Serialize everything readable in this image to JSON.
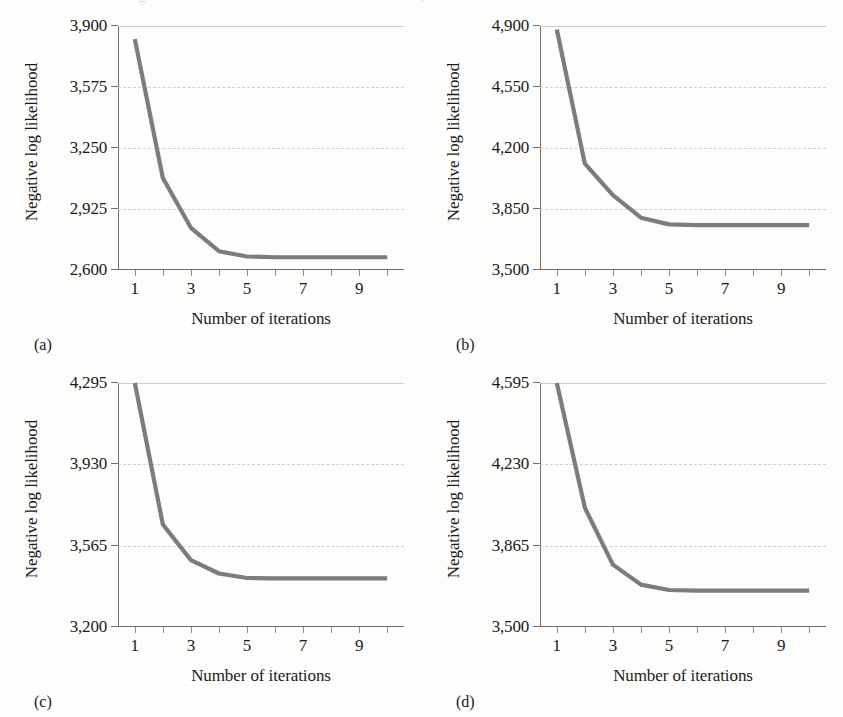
{
  "figure": {
    "background_color": "#fdfdfc",
    "curve_color": "#7c7c7c",
    "axis_color": "#6f6f6f",
    "gridline_color": "#c9c9cf",
    "top_bleed_a": "g",
    "top_bleed_b": "i"
  },
  "axis_titles": {
    "y": "Negative log likelihood",
    "x": "Number of iterations"
  },
  "captions": {
    "a": "(a)",
    "b": "(b)",
    "c": "(c)",
    "d": "(d)"
  },
  "chart_data": [
    {
      "id": "a",
      "type": "line",
      "title": "(a)",
      "xlabel": "Number of iterations",
      "ylabel": "Negative log likelihood",
      "x": [
        1,
        2,
        3,
        4,
        5,
        6,
        7,
        8,
        9,
        10
      ],
      "values": [
        3830,
        3090,
        2825,
        2700,
        2672,
        2668,
        2668,
        2668,
        2668,
        2668
      ],
      "series": [
        {
          "name": "Negative log likelihood",
          "values": [
            3830,
            3090,
            2825,
            2700,
            2672,
            2668,
            2668,
            2668,
            2668,
            2668
          ]
        }
      ],
      "xlim": [
        0.4,
        10.6
      ],
      "ylim": [
        2600,
        3900
      ],
      "yticks": [
        3900,
        3575,
        3250,
        2925,
        2600
      ],
      "ytick_labels": [
        "3,900",
        "3,575",
        "3,250",
        "2,925",
        "2,600"
      ],
      "xticks": [
        1,
        3,
        5,
        7,
        9
      ],
      "xtick_labels": [
        "1",
        "3",
        "5",
        "7",
        "9"
      ],
      "grid": true,
      "legend": "none"
    },
    {
      "id": "b",
      "type": "line",
      "title": "(b)",
      "xlabel": "Number of iterations",
      "ylabel": "Negative log likelihood",
      "x": [
        1,
        2,
        3,
        4,
        5,
        6,
        7,
        8,
        9,
        10
      ],
      "values": [
        4880,
        4110,
        3930,
        3800,
        3762,
        3758,
        3758,
        3758,
        3758,
        3758
      ],
      "series": [
        {
          "name": "Negative log likelihood",
          "values": [
            4880,
            4110,
            3930,
            3800,
            3762,
            3758,
            3758,
            3758,
            3758,
            3758
          ]
        }
      ],
      "xlim": [
        0.4,
        10.6
      ],
      "ylim": [
        3500,
        4900
      ],
      "yticks": [
        4900,
        4550,
        4200,
        3850,
        3500
      ],
      "ytick_labels": [
        "4,900",
        "4,550",
        "4,200",
        "3,850",
        "3,500"
      ],
      "xticks": [
        1,
        3,
        5,
        7,
        9
      ],
      "xtick_labels": [
        "1",
        "3",
        "5",
        "7",
        "9"
      ],
      "grid": true,
      "legend": "none"
    },
    {
      "id": "c",
      "type": "line",
      "title": "(c)",
      "xlabel": "Number of iterations",
      "ylabel": "Negative log likelihood",
      "x": [
        1,
        2,
        3,
        4,
        5,
        6,
        7,
        8,
        9,
        10
      ],
      "values": [
        4295,
        3660,
        3500,
        3440,
        3420,
        3418,
        3418,
        3418,
        3418,
        3418
      ],
      "series": [
        {
          "name": "Negative log likelihood",
          "values": [
            4295,
            3660,
            3500,
            3440,
            3420,
            3418,
            3418,
            3418,
            3418,
            3418
          ]
        }
      ],
      "xlim": [
        0.4,
        10.6
      ],
      "ylim": [
        3200,
        4295
      ],
      "yticks": [
        4295,
        3930,
        3565,
        3200
      ],
      "ytick_labels": [
        "4,295",
        "3,930",
        "3,565",
        "3,200"
      ],
      "xticks": [
        1,
        3,
        5,
        7,
        9
      ],
      "xtick_labels": [
        "1",
        "3",
        "5",
        "7",
        "9"
      ],
      "grid": true,
      "legend": "none"
    },
    {
      "id": "d",
      "type": "line",
      "title": "(d)",
      "xlabel": "Number of iterations",
      "ylabel": "Negative log likelihood",
      "x": [
        1,
        2,
        3,
        4,
        5,
        6,
        7,
        8,
        9,
        10
      ],
      "values": [
        4595,
        4035,
        3780,
        3690,
        3666,
        3663,
        3663,
        3663,
        3663,
        3663
      ],
      "series": [
        {
          "name": "Negative log likelihood",
          "values": [
            4595,
            4035,
            3780,
            3690,
            3666,
            3663,
            3663,
            3663,
            3663,
            3663
          ]
        }
      ],
      "xlim": [
        0.4,
        10.6
      ],
      "ylim": [
        3500,
        4595
      ],
      "yticks": [
        4595,
        4230,
        3865,
        3500
      ],
      "ytick_labels": [
        "4,595",
        "4,230",
        "3,865",
        "3,500"
      ],
      "xticks": [
        1,
        3,
        5,
        7,
        9
      ],
      "xtick_labels": [
        "1",
        "3",
        "5",
        "7",
        "9"
      ],
      "grid": true,
      "legend": "none"
    }
  ]
}
